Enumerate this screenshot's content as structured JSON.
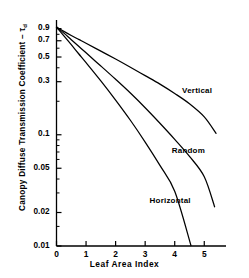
{
  "figure": {
    "background": "#ffffff",
    "ink_color": "#000000"
  },
  "axis": {
    "y_title_text": "Canopy Diffuse Transmission Coefficient – τ",
    "y_title_subscript": "d",
    "x_title": "Leaf Area Index",
    "y_tick_labels": [
      "0.9",
      "0.7",
      "0.5",
      "0.3",
      "0.1",
      "0.05",
      "0.02",
      "0.01"
    ],
    "y_tick_values": [
      0.9,
      0.7,
      0.5,
      0.3,
      0.1,
      0.05,
      0.02,
      0.01
    ],
    "x_tick_labels": [
      "0",
      "1",
      "2",
      "3",
      "4",
      "5"
    ],
    "x_tick_values": [
      0,
      1,
      2,
      3,
      4,
      5
    ]
  },
  "curve_labels": [
    {
      "name": "vertical",
      "text": "Vertical"
    },
    {
      "name": "random",
      "text": "Random"
    },
    {
      "name": "horizontal",
      "text": "Horizontal"
    }
  ],
  "chart_data": {
    "type": "line",
    "title": "",
    "subtitle": "",
    "xlabel": "Leaf Area Index",
    "ylabel": "Canopy Diffuse Transmission Coefficient – τd",
    "xscale": "linear",
    "yscale": "log",
    "xlim": [
      0,
      5.6
    ],
    "ylim": [
      0.01,
      0.95
    ],
    "grid": false,
    "legend": "inline-curve-labels",
    "xticks": [
      0,
      1,
      2,
      3,
      4,
      5
    ],
    "yticks": [
      0.01,
      0.02,
      0.05,
      0.1,
      0.3,
      0.5,
      0.7,
      0.9
    ],
    "ytick_labels": [
      "0.01",
      "0.02",
      "0.05",
      "0.1",
      "0.3",
      "0.5",
      "0.7",
      "0.9"
    ],
    "series": [
      {
        "name": "Vertical",
        "x": [
          0,
          0.25,
          0.5,
          0.75,
          1.0,
          1.5,
          2.0,
          2.5,
          3.0,
          3.5,
          4.0,
          4.5,
          5.0,
          5.4
        ],
        "y": [
          0.93,
          0.85,
          0.78,
          0.72,
          0.665,
          0.565,
          0.48,
          0.405,
          0.34,
          0.285,
          0.235,
          0.19,
          0.145,
          0.103
        ]
      },
      {
        "name": "Random",
        "x": [
          0,
          0.25,
          0.5,
          0.75,
          1.0,
          1.5,
          2.0,
          2.5,
          3.0,
          3.5,
          4.0,
          4.5,
          5.0,
          5.35
        ],
        "y": [
          0.93,
          0.82,
          0.715,
          0.625,
          0.545,
          0.415,
          0.315,
          0.237,
          0.175,
          0.127,
          0.091,
          0.064,
          0.042,
          0.0225
        ]
      },
      {
        "name": "Horizontal",
        "x": [
          0,
          0.25,
          0.5,
          0.75,
          1.0,
          1.5,
          2.0,
          2.5,
          3.0,
          3.5,
          4.0,
          4.55
        ],
        "y": [
          0.93,
          0.775,
          0.645,
          0.535,
          0.445,
          0.305,
          0.205,
          0.135,
          0.086,
          0.053,
          0.031,
          0.0101
        ]
      }
    ],
    "annotations": [
      {
        "text": "Vertical",
        "x": 4.25,
        "y": 0.245
      },
      {
        "text": "Random",
        "x": 3.9,
        "y": 0.072
      },
      {
        "text": "Horizontal",
        "x": 3.15,
        "y": 0.0255
      }
    ]
  }
}
